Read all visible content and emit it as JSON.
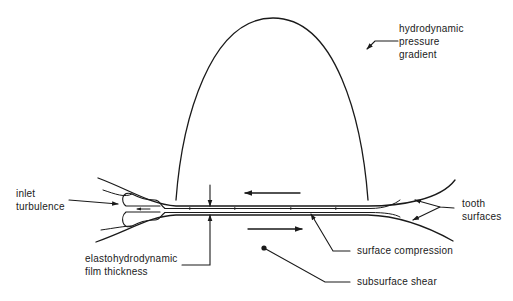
{
  "figure": {
    "type": "elastohydrodynamic lubrication contact diagram",
    "colors": {
      "ink": "#1a1a1a",
      "background": "#ffffff"
    }
  },
  "labels": {
    "pressure": [
      "hydrodynamic",
      "pressure",
      "gradient"
    ],
    "inlet": [
      "inlet",
      "turbulence"
    ],
    "tooth": [
      "tooth",
      "surfaces"
    ],
    "film": [
      "elastohydrodynamic",
      "film thickness"
    ],
    "compression": "surface compression",
    "shear": "subsurface shear"
  },
  "elements": {
    "pressure_curve": "parabolic pressure distribution above contact",
    "upper_surface_motion": "leftward arrow",
    "lower_surface_motion": "rightward arrow",
    "film_thickness_marker": "opposing vertical arrows across oil film",
    "subsurface_point": "dot below contact"
  }
}
